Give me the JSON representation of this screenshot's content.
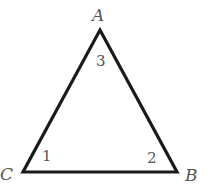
{
  "diagram": {
    "type": "triangle",
    "colors": {
      "stroke": "#1a1a1a",
      "label": "#555555",
      "background": "#ffffff"
    },
    "vertices": [
      {
        "name": "A",
        "x": 100,
        "y": 30
      },
      {
        "name": "B",
        "x": 177,
        "y": 172
      },
      {
        "name": "C",
        "x": 23,
        "y": 172
      }
    ],
    "vertex_labels": {
      "A": "A",
      "B": "B",
      "C": "C"
    },
    "angle_labels": {
      "angle_1": "1",
      "angle_2": "2",
      "angle_3": "3"
    }
  }
}
